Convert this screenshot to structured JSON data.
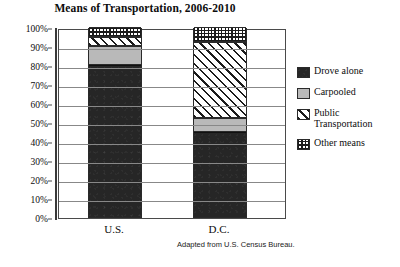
{
  "chart_data": {
    "type": "bar",
    "subtype": "stacked-bar-100-percent",
    "title": "Means of Transportation, 2006-2010",
    "xlabel": "",
    "ylabel": "",
    "ylim": [
      0,
      100
    ],
    "grid": true,
    "legend_position": "right",
    "categories": [
      "U.S.",
      "D.C."
    ],
    "tick_labels": [
      "0%",
      "10%",
      "20%",
      "30%",
      "40%",
      "50%",
      "60%",
      "70%",
      "80%",
      "90%",
      "100%"
    ],
    "tick_values": [
      0,
      10,
      20,
      30,
      40,
      50,
      60,
      70,
      80,
      90,
      100
    ],
    "series": [
      {
        "name": "Drove alone",
        "values": [
          80,
          45
        ],
        "fill": "solid-dark",
        "color": "#262626"
      },
      {
        "name": "Carpooled",
        "values": [
          10,
          7
        ],
        "fill": "solid-light",
        "color": "#b9b9b9"
      },
      {
        "name": "Public Transportation",
        "values": [
          5,
          40
        ],
        "fill": "diagonal-hatch",
        "color": "#ffffff"
      },
      {
        "name": "Other means",
        "values": [
          5,
          8
        ],
        "fill": "grid-dots",
        "color": "#ffffff"
      }
    ],
    "annotations": [
      "Adapted from U.S. Census Bureau."
    ]
  },
  "title": "Means of Transportation, 2006-2010",
  "source_note": "Adapted from U.S. Census Bureau.",
  "axis": {
    "y_ticks": [
      "100%",
      "90%",
      "80%",
      "70%",
      "60%",
      "50%",
      "40%",
      "30%",
      "20%",
      "10%",
      "0%"
    ],
    "x_ticks": [
      "U.S.",
      "D.C."
    ]
  },
  "legend": {
    "items": [
      {
        "label": "Drove alone"
      },
      {
        "label": "Carpooled"
      },
      {
        "label": "Public Transportation"
      },
      {
        "label": "Other means"
      }
    ]
  }
}
